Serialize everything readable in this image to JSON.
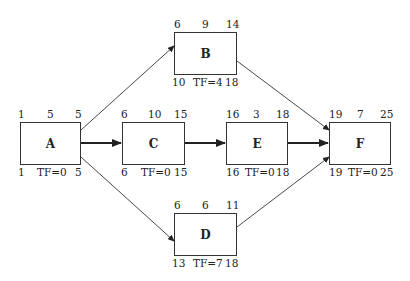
{
  "diagram": {
    "type": "activity-on-node network",
    "nodes": [
      {
        "id": "A",
        "es": "1",
        "dur": "5",
        "ef": "5",
        "ls": "1",
        "tf": "TF=0",
        "lf": "5",
        "box": [
          20,
          122,
          61,
          43
        ]
      },
      {
        "id": "B",
        "es": "6",
        "dur": "9",
        "ef": "14",
        "ls": "10",
        "tf": "TF=4",
        "lf": "18",
        "box": [
          174,
          32,
          63,
          43
        ]
      },
      {
        "id": "C",
        "es": "6",
        "dur": "10",
        "ef": "15",
        "ls": "6",
        "tf": "TF=0",
        "lf": "15",
        "box": [
          122,
          122,
          63,
          43
        ]
      },
      {
        "id": "D",
        "es": "6",
        "dur": "6",
        "ef": "11",
        "ls": "13",
        "tf": "TF=7",
        "lf": "18",
        "box": [
          174,
          213,
          63,
          43
        ]
      },
      {
        "id": "E",
        "es": "16",
        "dur": "3",
        "ef": "18",
        "ls": "16",
        "tf": "TF=0",
        "lf": "18",
        "box": [
          226,
          122,
          62,
          43
        ]
      },
      {
        "id": "F",
        "es": "19",
        "dur": "7",
        "ef": "25",
        "ls": "19",
        "tf": "TF=0",
        "lf": "25",
        "box": [
          329,
          122,
          62,
          43
        ]
      }
    ],
    "edges": [
      {
        "from": "A",
        "to": "B",
        "critical": false
      },
      {
        "from": "A",
        "to": "C",
        "critical": true
      },
      {
        "from": "A",
        "to": "D",
        "critical": false
      },
      {
        "from": "B",
        "to": "F",
        "critical": false
      },
      {
        "from": "C",
        "to": "E",
        "critical": true
      },
      {
        "from": "E",
        "to": "F",
        "critical": true
      },
      {
        "from": "D",
        "to": "F",
        "critical": false
      }
    ]
  }
}
